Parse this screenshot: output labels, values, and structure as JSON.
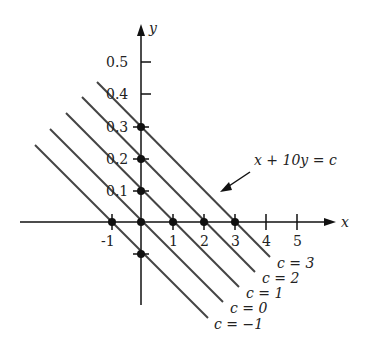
{
  "diagram": {
    "axes": {
      "x_label": "x",
      "y_label": "y",
      "x_ticks": [
        "-1",
        "1",
        "2",
        "3",
        "4",
        "5"
      ],
      "y_ticks": [
        "0.1",
        "0.2",
        "0.3",
        "0.4",
        "0.5"
      ]
    },
    "equation_label": "x + 10y = c",
    "lines": [
      {
        "c": 3,
        "label": "c = 3"
      },
      {
        "c": 2,
        "label": "c = 2"
      },
      {
        "c": 1,
        "label": "c = 1"
      },
      {
        "c": 0,
        "label": "c = 0"
      },
      {
        "c": -1,
        "label": "c = −1"
      }
    ],
    "marked_points": [
      {
        "x": -1,
        "y": 0
      },
      {
        "x": 0,
        "y": 0
      },
      {
        "x": 1,
        "y": 0
      },
      {
        "x": 2,
        "y": 0
      },
      {
        "x": 3,
        "y": 0
      },
      {
        "x": 0,
        "y": 0.1
      },
      {
        "x": 0,
        "y": 0.2
      },
      {
        "x": 0,
        "y": 0.3
      },
      {
        "x": 0,
        "y": -0.1
      }
    ],
    "colors": {
      "axis": "#111111",
      "level_line": "#444444",
      "text": "#222222"
    }
  }
}
